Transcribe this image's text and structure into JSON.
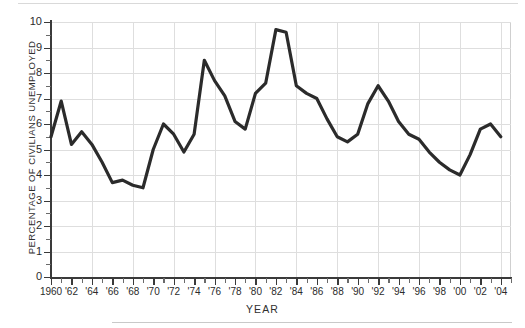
{
  "chart_data": {
    "type": "line",
    "title": "",
    "xlabel": "YEAR",
    "ylabel": "PERCENTAGE OF CIVILIANS UNEMPLOYED",
    "xlim": [
      1960,
      2005
    ],
    "ylim": [
      0,
      10
    ],
    "grid": true,
    "legend": "none",
    "line_color": "#2b2b2b",
    "x_tick_labels": [
      "1960",
      "'62",
      "'64",
      "'66",
      "'68",
      "'70",
      "'72",
      "'74",
      "'76",
      "'78",
      "'80",
      "'82",
      "'84",
      "'86",
      "'88",
      "'90",
      "'92",
      "'94",
      "'96",
      "'98",
      "'00",
      "'02",
      "'04"
    ],
    "x_tick_values": [
      1960,
      1962,
      1964,
      1966,
      1968,
      1970,
      1972,
      1974,
      1976,
      1978,
      1980,
      1982,
      1984,
      1986,
      1988,
      1990,
      1992,
      1994,
      1996,
      1998,
      2000,
      2002,
      2004
    ],
    "y_tick_labels": [
      "0",
      "1",
      "2",
      "3",
      "4",
      "5",
      "6",
      "7",
      "8",
      "9",
      "10"
    ],
    "y_tick_values": [
      0,
      1,
      2,
      3,
      4,
      5,
      6,
      7,
      8,
      9,
      10
    ],
    "x": [
      1960,
      1961,
      1962,
      1963,
      1964,
      1965,
      1966,
      1967,
      1968,
      1969,
      1970,
      1971,
      1972,
      1973,
      1974,
      1975,
      1976,
      1977,
      1978,
      1979,
      1980,
      1981,
      1982,
      1983,
      1984,
      1985,
      1986,
      1987,
      1988,
      1989,
      1990,
      1991,
      1992,
      1993,
      1994,
      1995,
      1996,
      1997,
      1998,
      1999,
      2000,
      2001,
      2002,
      2003,
      2004
    ],
    "values": [
      5.5,
      6.9,
      5.2,
      5.7,
      5.2,
      4.5,
      3.7,
      3.8,
      3.6,
      3.5,
      5.0,
      6.0,
      5.6,
      4.9,
      5.6,
      8.5,
      7.7,
      7.1,
      6.1,
      5.8,
      7.2,
      7.6,
      9.7,
      9.6,
      7.5,
      7.2,
      7.0,
      6.2,
      5.5,
      5.3,
      5.6,
      6.8,
      7.5,
      6.9,
      6.1,
      5.6,
      5.4,
      4.9,
      4.5,
      4.2,
      4.0,
      4.8,
      5.8,
      6.0,
      5.5
    ],
    "series_name": "Percentage of civilians unemployed"
  }
}
